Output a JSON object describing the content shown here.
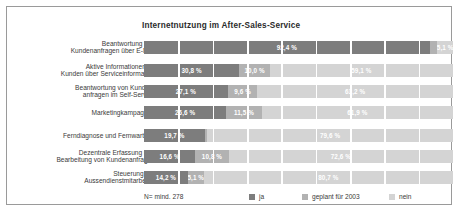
{
  "chart_data": {
    "type": "bar",
    "orientation": "horizontal",
    "stacked": true,
    "normalized_percent": true,
    "title": "Internetnutzung im After-Sales-Service",
    "xlabel": "",
    "ylabel": "",
    "xlim": [
      0,
      100
    ],
    "grid": false,
    "legend_position": "bottom-right",
    "note": "N= mind. 278",
    "categories": [
      "Beantwortung von\nKundenanfragen über E-Mail",
      "Aktive Informationen an\nKunden über Serviceinformation",
      "Beantwortung von Kunden-\nanfragen im Self-Service",
      "Marketingkampagnen",
      "Ferndiagnose und Fernwartung",
      "Dezentrale Erfassung und\nBearbeitung von Kundenanfragen",
      "Steuerung der\nAussendienstmitarbeiter"
    ],
    "series": [
      {
        "name": "ja",
        "color": "#7d7d7d",
        "values": [
          92.4,
          30.8,
          27.1,
          26.6,
          19.7,
          16.6,
          14.2
        ],
        "labels": [
          "92,4 %",
          "30,8 %",
          "27,1 %",
          "26,6 %",
          "19,7 %",
          "16,6 %",
          "14,2 %"
        ]
      },
      {
        "name": "geplant für 2003",
        "color": "#b2b2b2",
        "values": [
          2.5,
          10.0,
          9.6,
          11.5,
          0.7,
          10.8,
          5.1
        ],
        "labels": [
          "",
          "10,0 %",
          "9,6 %",
          "11,5 %",
          "",
          "10,8 %",
          "5,1 %"
        ]
      },
      {
        "name": "nein",
        "color": "#d4d4d4",
        "values": [
          5.1,
          59.1,
          63.2,
          61.9,
          79.6,
          72.6,
          80.7
        ],
        "labels": [
          "5,1 %",
          "59,1 %",
          "63,2 %",
          "61,9 %",
          "79,6 %",
          "72,6 %",
          "80,7 %"
        ]
      }
    ]
  },
  "legend": {
    "items": [
      {
        "label": "ja",
        "color": "#7d7d7d"
      },
      {
        "label": "geplant für 2003",
        "color": "#b2b2b2"
      },
      {
        "label": "nein",
        "color": "#d4d4d4"
      }
    ]
  },
  "footer": {
    "n_note": "N= mind. 278"
  },
  "style": {
    "frame_border": "#9a9a9a",
    "background": "#ffffff",
    "title_color": "#2b2b2b",
    "label_color": "#3a3a3a",
    "value_label_color": "#ffffff",
    "tick_separator_color": "#ffffff"
  }
}
